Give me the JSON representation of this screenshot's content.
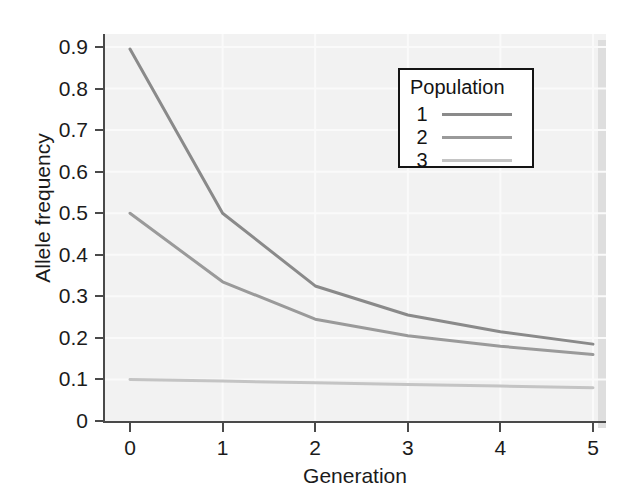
{
  "chart_data": {
    "type": "line",
    "title": "",
    "xlabel": "Generation",
    "ylabel": "Allele frequency",
    "x": [
      0,
      1,
      2,
      3,
      4,
      5
    ],
    "xlim": [
      0,
      5
    ],
    "ylim": [
      0,
      0.93
    ],
    "grid": true,
    "legend_position": "upper-right",
    "legend_title": "Population",
    "xticks": [
      "0",
      "1",
      "2",
      "3",
      "4",
      "5"
    ],
    "yticks": [
      "0",
      "0.1",
      "0.2",
      "0.3",
      "0.4",
      "0.5",
      "0.6",
      "0.7",
      "0.8",
      "0.9"
    ],
    "ytick_values": [
      0,
      0.1,
      0.2,
      0.3,
      0.4,
      0.5,
      0.6,
      0.7,
      0.8,
      0.9
    ],
    "series": [
      {
        "name": "1",
        "color": "#8a8a8a",
        "values": [
          0.895,
          0.5,
          0.325,
          0.255,
          0.215,
          0.185
        ]
      },
      {
        "name": "2",
        "color": "#9a9a9a",
        "values": [
          0.5,
          0.335,
          0.245,
          0.205,
          0.18,
          0.16
        ]
      },
      {
        "name": "3",
        "color": "#c4c4c4",
        "values": [
          0.1,
          0.096,
          0.092,
          0.088,
          0.084,
          0.08
        ]
      }
    ]
  },
  "legend": {
    "title": "Population",
    "entries": [
      {
        "label": "1",
        "color": "#8a8a8a"
      },
      {
        "label": "2",
        "color": "#9a9a9a"
      },
      {
        "label": "3",
        "color": "#c4c4c4"
      }
    ]
  },
  "axes": {
    "y_title": "Allele frequency",
    "x_title": "Generation",
    "y_ticks": [
      "0.9",
      "0.8",
      "0.7",
      "0.6",
      "0.5",
      "0.4",
      "0.3",
      "0.2",
      "0.1",
      "0"
    ],
    "x_ticks": [
      "0",
      "1",
      "2",
      "3",
      "4",
      "5"
    ]
  },
  "colors": {
    "plot_background": "#f2f2f2",
    "page_background": "#ffffff",
    "axis": "#4a4a4a",
    "gridline": "#fafafa",
    "text": "#1b1b1b",
    "legend_border": "#141414"
  }
}
